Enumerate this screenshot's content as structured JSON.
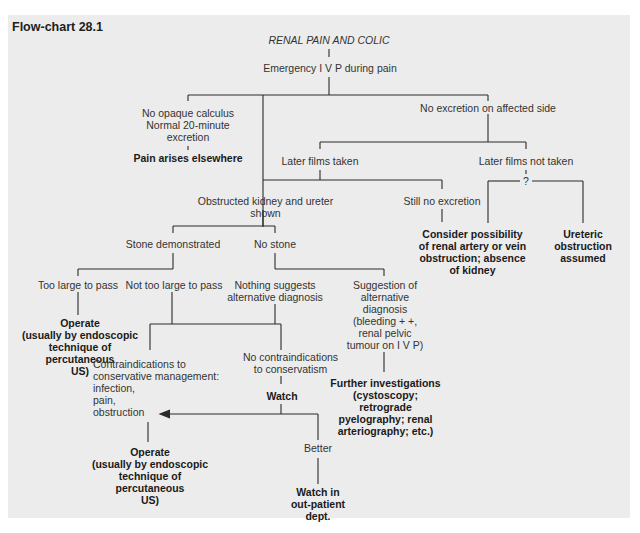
{
  "figure": {
    "label": "Flow-chart 28.1",
    "background_color": "#ececec",
    "line_color": "#2b2b2b"
  },
  "nodes": {
    "root": "RENAL PAIN AND COLIC",
    "ivp": "Emergency I V P during pain",
    "no_opaque": "No opaque calculus\nNormal 20-minute\nexcretion",
    "pain_elsewhere": "Pain arises elsewhere",
    "no_excretion": "No excretion on affected side",
    "later_taken": "Later films taken",
    "later_not_taken": "Later films not taken",
    "question": "?",
    "obstructed": "Obstructed kidney and ureter shown",
    "still_no_excretion": "Still no excretion",
    "consider_renal": "Consider possibility\nof renal artery or vein\nobstruction; absence\nof kidney",
    "ureteric_assumed": "Ureteric\nobstruction\nassumed",
    "stone_demonstrated": "Stone demonstrated",
    "no_stone": "No stone",
    "too_large": "Too large to pass",
    "not_too_large": "Not too large to pass",
    "nothing_suggests": "Nothing  suggests\nalternative diagnosis",
    "suggestion_alt": "Suggestion of\nalternative\ndiagnosis\n(bleeding + +,\nrenal pelvic\ntumour on I V P)",
    "operate_1": "Operate\n(usually by endoscopic\ntechnique of percutaneous\nUS)",
    "contraindications": "Contraindications to\nconservative management:\ninfection,\npain,\nobstruction",
    "no_contraindications": "No contraindications\nto conservatism",
    "further_investigations": "Further investigations\n(cystoscopy; retrograde\npyelography; renal\narteriography; etc.)",
    "watch": "Watch",
    "better": "Better",
    "operate_2": "Operate\n(usually by endoscopic\ntechnique of percutaneous\nUS)",
    "watch_outpatient": "Watch in\nout-patient\ndept."
  }
}
